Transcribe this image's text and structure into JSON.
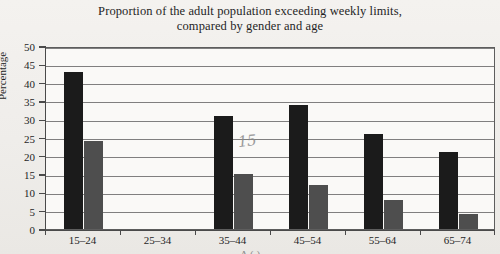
{
  "title": {
    "line1": "Proportion of the adult population exceeding weekly limits,",
    "line2": "compared by gender and age"
  },
  "axes": {
    "ylabel": "Percentage",
    "xlabel_cutoff": "A ( )"
  },
  "annotation": {
    "handwritten_note": "15"
  },
  "colors": {
    "male_bar": "#1b1b1b",
    "female_bar": "#4e4e4e",
    "page_background": "#f2f0ec",
    "plot_background": "#faf9f7",
    "grid": "#6a6a6a"
  },
  "chart_data": {
    "type": "bar",
    "title": "Proportion of the adult population exceeding weekly limits, compared by gender and age",
    "xlabel": "",
    "ylabel": "Percentage",
    "ylim": [
      0,
      50
    ],
    "yticks": [
      0,
      5,
      10,
      15,
      20,
      25,
      30,
      35,
      40,
      45,
      50
    ],
    "grid": true,
    "legend": "none",
    "categories": [
      "15–24",
      "25–34",
      "35–44",
      "45–54",
      "55–64",
      "65–74"
    ],
    "series": [
      {
        "name": "Men",
        "color": "#1b1b1b",
        "values": [
          43,
          null,
          31,
          34,
          26,
          21
        ]
      },
      {
        "name": "Women",
        "color": "#4e4e4e",
        "values": [
          24,
          null,
          15,
          12,
          8,
          4
        ]
      }
    ]
  }
}
